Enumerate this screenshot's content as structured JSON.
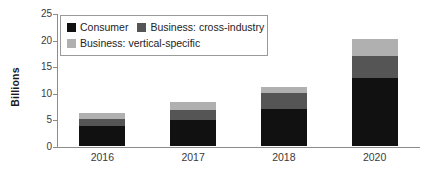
{
  "chart_data": {
    "type": "bar",
    "subtype": "stacked-bar",
    "title": "",
    "xlabel": "",
    "ylabel": "Billions",
    "ylim": [
      0,
      25
    ],
    "yticks": [
      0,
      5,
      10,
      15,
      20,
      25
    ],
    "ytick_labels": [
      "0",
      "5",
      "10",
      "15",
      "20",
      "25"
    ],
    "grid": false,
    "legend_position": "upper-left-inside",
    "categories": [
      "2016",
      "2017",
      "2018",
      "2020"
    ],
    "series": [
      {
        "name": "Consumer",
        "color": "#111111",
        "values": [
          3.8,
          4.9,
          7.0,
          12.8
        ]
      },
      {
        "name": "Business: cross-industry",
        "color": "#555555",
        "values": [
          1.3,
          1.9,
          3.0,
          4.2
        ]
      },
      {
        "name": "Business: vertical-specific",
        "color": "#b0b0b0",
        "values": [
          1.1,
          1.5,
          1.1,
          3.2
        ]
      }
    ],
    "totals": [
      6.2,
      8.3,
      11.1,
      20.2
    ]
  },
  "legend": {
    "entries": [
      {
        "label": "Consumer",
        "color": "#111111"
      },
      {
        "label": "Business: cross-industry",
        "color": "#555555"
      },
      {
        "label": "Business: vertical-specific",
        "color": "#b0b0b0"
      }
    ]
  },
  "axis": {
    "y_title": "Billions",
    "y_labels": [
      "25",
      "20",
      "15",
      "10",
      "5",
      "0"
    ],
    "x_labels": [
      "2016",
      "2017",
      "2018",
      "2020"
    ]
  }
}
